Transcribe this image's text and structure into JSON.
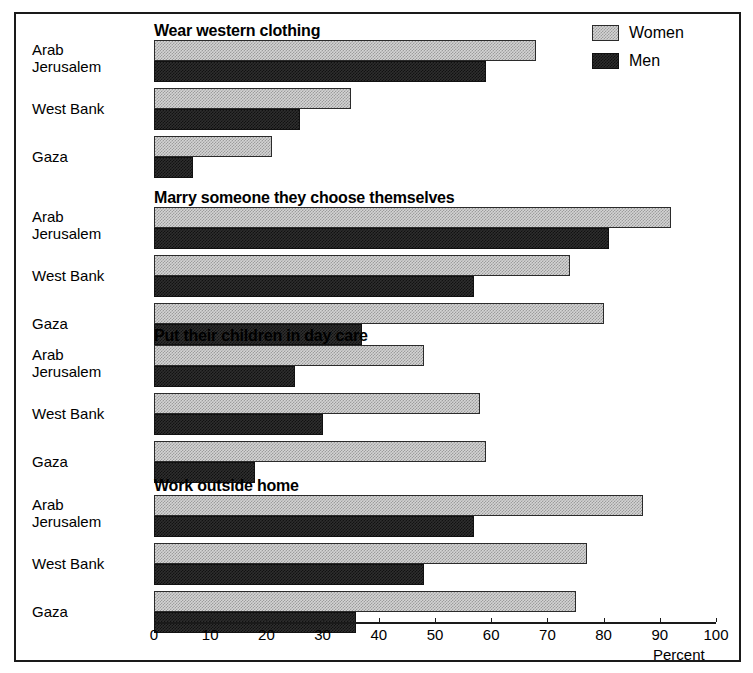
{
  "scan_artifact_text": " ",
  "legend": {
    "items": [
      {
        "label": "Women",
        "swatch": "women"
      },
      {
        "label": "Men",
        "swatch": "men"
      }
    ]
  },
  "axis": {
    "title": "Percent",
    "ticks": [
      "0",
      "10",
      "20",
      "30",
      "40",
      "50",
      "60",
      "70",
      "80",
      "90",
      "100"
    ],
    "min": 0,
    "max": 100
  },
  "categories": [
    "Arab\nJerusalem",
    "West Bank",
    "Gaza"
  ],
  "category_labels": {
    "arab_jerusalem_line1": "Arab",
    "arab_jerusalem_line2": "Jerusalem",
    "west_bank": "West Bank",
    "gaza": "Gaza"
  },
  "panels": [
    {
      "title": "Wear western clothing"
    },
    {
      "title": "Marry someone they choose themselves"
    },
    {
      "title": "Put their children in day care"
    },
    {
      "title": "Work outside home"
    }
  ],
  "chart_data": {
    "type": "bar",
    "orientation": "horizontal",
    "title": "",
    "xlabel": "Percent",
    "ylabel": "",
    "xlim": [
      0,
      100
    ],
    "xticks": [
      0,
      10,
      20,
      30,
      40,
      50,
      60,
      70,
      80,
      90,
      100
    ],
    "grid": false,
    "legend": [
      "Women",
      "Men"
    ],
    "legend_position": "top-right",
    "categories": [
      "Arab Jerusalem",
      "West Bank",
      "Gaza"
    ],
    "panels": [
      {
        "title": "Wear western clothing",
        "series": [
          {
            "name": "Women",
            "values": [
              68,
              35,
              21
            ]
          },
          {
            "name": "Men",
            "values": [
              59,
              26,
              7
            ]
          }
        ]
      },
      {
        "title": "Marry someone they choose themselves",
        "series": [
          {
            "name": "Women",
            "values": [
              92,
              74,
              80
            ]
          },
          {
            "name": "Men",
            "values": [
              81,
              57,
              37
            ]
          }
        ]
      },
      {
        "title": "Put their children in day care",
        "series": [
          {
            "name": "Women",
            "values": [
              48,
              58,
              59
            ]
          },
          {
            "name": "Men",
            "values": [
              25,
              30,
              18
            ]
          }
        ]
      },
      {
        "title": "Work outside home",
        "series": [
          {
            "name": "Women",
            "values": [
              87,
              77,
              75
            ]
          },
          {
            "name": "Men",
            "values": [
              57,
              48,
              36
            ]
          }
        ]
      }
    ]
  }
}
